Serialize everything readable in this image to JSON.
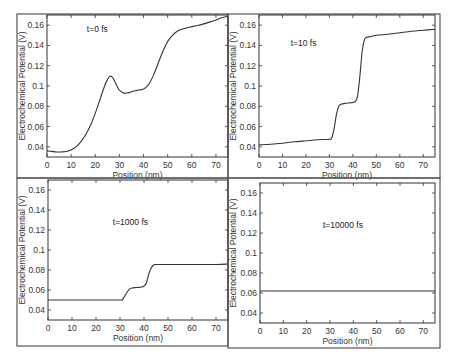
{
  "chart_data": [
    {
      "type": "line",
      "panel": "top-left",
      "annotation": "t=0 fs",
      "xlabel": "Position (nm)",
      "ylabel": "Electrochemical Potential (V)",
      "xlim": [
        0,
        75
      ],
      "ylim": [
        0.03,
        0.17
      ],
      "xticks": [
        0,
        10,
        20,
        30,
        40,
        50,
        60,
        70
      ],
      "yticks": [
        0.04,
        0.06,
        0.08,
        0.1,
        0.12,
        0.14,
        0.16
      ],
      "ytick_labels": [
        "0.04",
        "0.06",
        "0.08",
        "0.1",
        "0.12",
        "0.14",
        "0.16"
      ],
      "grid": false,
      "x": [
        0,
        2,
        4,
        6,
        8,
        10,
        12,
        14,
        16,
        18,
        20,
        22,
        24,
        25,
        26,
        27,
        28,
        29,
        30,
        32,
        34,
        36,
        38,
        40,
        42,
        44,
        46,
        48,
        50,
        52,
        54,
        56,
        58,
        60,
        62,
        64,
        66,
        68,
        70,
        72,
        75
      ],
      "y": [
        0.036,
        0.0355,
        0.035,
        0.035,
        0.0355,
        0.037,
        0.04,
        0.045,
        0.052,
        0.061,
        0.073,
        0.087,
        0.101,
        0.106,
        0.1095,
        0.109,
        0.105,
        0.1,
        0.096,
        0.093,
        0.0935,
        0.095,
        0.096,
        0.097,
        0.101,
        0.11,
        0.122,
        0.134,
        0.144,
        0.15,
        0.154,
        0.156,
        0.1575,
        0.1585,
        0.1595,
        0.1605,
        0.162,
        0.1635,
        0.165,
        0.167,
        0.169
      ]
    },
    {
      "type": "line",
      "panel": "top-right",
      "annotation": "t=10 fs",
      "xlabel": "Position (nm)",
      "ylabel": "Electrochemical Potential (V)",
      "xlim": [
        0,
        75
      ],
      "ylim": [
        0.03,
        0.17
      ],
      "xticks": [
        0,
        10,
        20,
        30,
        40,
        50,
        60,
        70
      ],
      "yticks": [
        0.04,
        0.06,
        0.08,
        0.1,
        0.12,
        0.14,
        0.16
      ],
      "ytick_labels": [
        "0.04",
        "0.06",
        "0.08",
        "0.1",
        "0.12",
        "0.14",
        "0.16"
      ],
      "grid": false,
      "x": [
        0,
        5,
        10,
        15,
        20,
        25,
        30,
        31,
        32,
        33,
        34,
        35,
        37,
        39,
        41,
        42,
        43,
        44,
        45,
        46,
        48,
        50,
        55,
        60,
        65,
        70,
        75
      ],
      "y": [
        0.042,
        0.0425,
        0.0435,
        0.045,
        0.046,
        0.047,
        0.0475,
        0.049,
        0.058,
        0.072,
        0.08,
        0.082,
        0.083,
        0.0835,
        0.0845,
        0.09,
        0.11,
        0.135,
        0.146,
        0.148,
        0.149,
        0.15,
        0.151,
        0.1525,
        0.154,
        0.155,
        0.156
      ]
    },
    {
      "type": "line",
      "panel": "bottom-left",
      "annotation": "t=1000 fs",
      "xlabel": "Position (nm)",
      "ylabel": "Electrochemical Potential (V)",
      "xlim": [
        0,
        75
      ],
      "ylim": [
        0.03,
        0.17
      ],
      "xticks": [
        0,
        10,
        20,
        30,
        40,
        50,
        60,
        70
      ],
      "yticks": [
        0.04,
        0.06,
        0.08,
        0.1,
        0.12,
        0.14,
        0.16
      ],
      "ytick_labels": [
        "0.04",
        "0.06",
        "0.08",
        "0.1",
        "0.12",
        "0.14",
        "0.16"
      ],
      "grid": false,
      "x": [
        0,
        10,
        20,
        30,
        31,
        32,
        33,
        34,
        35,
        37,
        39,
        40,
        41,
        42,
        43,
        44,
        45,
        50,
        60,
        70,
        75
      ],
      "y": [
        0.05,
        0.05,
        0.05,
        0.05,
        0.0505,
        0.054,
        0.058,
        0.061,
        0.062,
        0.0625,
        0.063,
        0.064,
        0.067,
        0.076,
        0.082,
        0.085,
        0.0855,
        0.0855,
        0.0855,
        0.0855,
        0.086
      ]
    },
    {
      "type": "line",
      "panel": "bottom-right",
      "annotation": "t=10000 fs",
      "xlabel": "Position (nm)",
      "ylabel": "Electrochemical Potential (V)",
      "xlim": [
        0,
        75
      ],
      "ylim": [
        0.03,
        0.17
      ],
      "xticks": [
        0,
        10,
        20,
        30,
        40,
        50,
        60,
        70
      ],
      "yticks": [
        0.04,
        0.06,
        0.08,
        0.1,
        0.12,
        0.14,
        0.16
      ],
      "ytick_labels": [
        "0.04",
        "0.06",
        "0.08",
        "0.1",
        "0.12",
        "0.14",
        "0.16"
      ],
      "grid": false,
      "x": [
        0,
        75
      ],
      "y": [
        0.062,
        0.062
      ]
    }
  ],
  "layout": {
    "panels": [
      {
        "frame": [
          17,
          14,
          211,
          164
        ],
        "plot": [
          47,
          15,
          181,
          142
        ],
        "ann_pos": [
          0.22,
          0.12
        ]
      },
      {
        "frame": [
          228,
          14,
          212,
          164
        ],
        "plot": [
          259,
          15,
          176,
          142
        ],
        "ann_pos": [
          0.18,
          0.22
        ]
      },
      {
        "frame": [
          17,
          178,
          211,
          168
        ],
        "plot": [
          48,
          180,
          180,
          140
        ],
        "ann_pos": [
          0.36,
          0.32
        ]
      },
      {
        "frame": [
          228,
          178,
          212,
          170
        ],
        "plot": [
          260,
          183,
          175,
          140
        ],
        "ann_pos": [
          0.36,
          0.32
        ]
      }
    ]
  }
}
